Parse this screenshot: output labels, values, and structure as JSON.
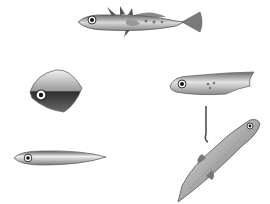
{
  "figure": {
    "background": "#ffffff",
    "models": [
      {
        "id": "realistic-stickleback",
        "position": "top-center",
        "description": "detailed stickleback with spines and fins"
      },
      {
        "id": "rhomboid-model",
        "position": "middle-left",
        "description": "diamond-shaped model with dark lower half"
      },
      {
        "id": "tadpole-model",
        "position": "middle-right",
        "description": "elongated blunt model with spots"
      },
      {
        "id": "cigar-model",
        "position": "bottom-left",
        "description": "elongated torpedo-shaped model"
      },
      {
        "id": "suspended-fish-model",
        "position": "bottom-right",
        "description": "realistic fish hanging diagonally from a wire"
      }
    ],
    "colors": {
      "body_light": "#e6e6e6",
      "body_mid": "#a8a8a8",
      "body_dark": "#3a3a3a",
      "outline": "#555555"
    }
  }
}
